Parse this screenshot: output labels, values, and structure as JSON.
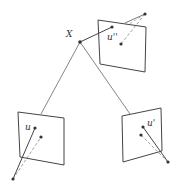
{
  "diagram": {
    "type": "multi-view projection",
    "point": {
      "label": "X",
      "x": 80,
      "y": 42
    },
    "views": [
      {
        "name": "left",
        "label": "u",
        "label_pos": [
          26,
          130
        ],
        "panel": [
          [
            18,
            112
          ],
          [
            64,
            118
          ],
          [
            64,
            165
          ],
          [
            20,
            157
          ]
        ],
        "image_point": [
          35,
          128
        ],
        "alt_point": [
          41,
          137
        ],
        "center": [
          13,
          179
        ]
      },
      {
        "name": "right",
        "label": "u'",
        "label_pos": [
          148,
          123
        ],
        "panel": [
          [
            122,
            116
          ],
          [
            161,
            108
          ],
          [
            162,
            151
          ],
          [
            123,
            162
          ]
        ],
        "image_point": [
          143,
          127
        ],
        "alt_point": [
          141,
          135
        ],
        "center": [
          168,
          162
        ]
      },
      {
        "name": "top",
        "label": "u''",
        "label_pos": [
          108,
          39
        ],
        "panel": [
          [
            98,
            20
          ],
          [
            146,
            27
          ],
          [
            145,
            72
          ],
          [
            100,
            64
          ]
        ],
        "image_point": [
          112,
          27
        ],
        "alt_point": [
          121,
          44
        ],
        "center": [
          145,
          14
        ]
      }
    ],
    "colors": {
      "line": "#555555",
      "dot": "#333333"
    },
    "caption": ""
  }
}
